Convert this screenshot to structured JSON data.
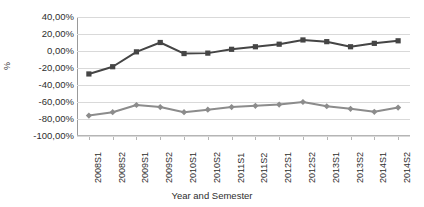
{
  "chart_data": {
    "type": "line",
    "title": "",
    "xlabel": "Year and Semester",
    "ylabel": "%",
    "categories": [
      "2008S1",
      "2008S2",
      "2009S1",
      "2009S2",
      "2010S1",
      "2010S2",
      "2011S1",
      "2011S2",
      "2012S1",
      "2012S2",
      "2013S1",
      "2013S2",
      "2014S1",
      "2014S2"
    ],
    "ylim": [
      -100,
      40
    ],
    "ytick_labels": [
      "40,00%",
      "20,00%",
      "0,00%",
      "-20,00%",
      "-40,00%",
      "-60,00%",
      "-80,00%",
      "-100,00%"
    ],
    "ytick_values": [
      40,
      20,
      0,
      -20,
      -40,
      -60,
      -80,
      -100
    ],
    "grid": true,
    "legend": "none",
    "series": [
      {
        "name": "series-1",
        "color": "#454545",
        "marker": "square",
        "values": [
          -27,
          -18.5,
          -1,
          10,
          -3,
          -2.5,
          2,
          5,
          8,
          13,
          11,
          5,
          9,
          12
        ]
      },
      {
        "name": "series-2",
        "color": "#8c8c8c",
        "marker": "diamond",
        "values": [
          -76,
          -72,
          -63.5,
          -66,
          -72,
          -69,
          -66,
          -64.5,
          -63,
          -60,
          -65,
          -68,
          -71.5,
          -66.5
        ]
      }
    ]
  }
}
